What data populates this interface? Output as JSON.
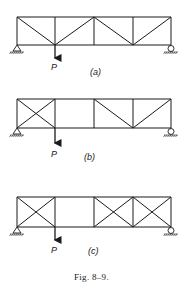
{
  "figure": {
    "caption": "Fig. 8–9.",
    "trusses": [
      {
        "id": "a",
        "label": "(a)",
        "load_label": "P",
        "top_y": 17,
        "bottom_y": 45,
        "panel_x": [
          17,
          55,
          94,
          133,
          171
        ],
        "diagonals": [
          [
            17,
            17,
            55,
            45
          ],
          [
            55,
            45,
            94,
            17
          ],
          [
            94,
            17,
            133,
            45
          ],
          [
            133,
            45,
            171,
            17
          ]
        ],
        "load_x": 55,
        "left_support": "pin",
        "right_support": "roller"
      },
      {
        "id": "b",
        "label": "(b)",
        "load_label": "P",
        "top_y": 99,
        "bottom_y": 128,
        "panel_x": [
          17,
          55,
          94,
          133,
          171
        ],
        "diagonals": [
          [
            17,
            99,
            55,
            128
          ],
          [
            17,
            128,
            55,
            99
          ],
          [
            94,
            99,
            133,
            128
          ],
          [
            133,
            128,
            171,
            99
          ]
        ],
        "verticals_omitted": [],
        "load_x": 55,
        "left_support": "pin",
        "right_support": "roller"
      },
      {
        "id": "c",
        "label": "(c)",
        "load_label": "P",
        "top_y": 197,
        "bottom_y": 227,
        "panel_x": [
          17,
          55,
          94,
          133,
          171
        ],
        "diagonals": [
          [
            17,
            197,
            55,
            227
          ],
          [
            17,
            227,
            55,
            197
          ],
          [
            94,
            197,
            133,
            227
          ],
          [
            94,
            227,
            133,
            197
          ],
          [
            133,
            197,
            171,
            227
          ],
          [
            133,
            227,
            171,
            197
          ]
        ],
        "load_x": 55,
        "left_support": "pin",
        "right_support": "roller"
      }
    ]
  }
}
